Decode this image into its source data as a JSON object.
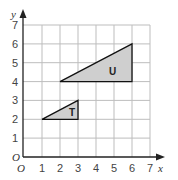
{
  "diagram": {
    "type": "coordinate-grid",
    "x_axis": {
      "label": "x",
      "ticks": [
        "1",
        "2",
        "3",
        "4",
        "5",
        "6",
        "7"
      ],
      "origin_label": "O"
    },
    "y_axis": {
      "label": "y",
      "ticks": [
        "1",
        "2",
        "3",
        "4",
        "5",
        "6",
        "7"
      ],
      "origin_label": "O"
    },
    "shapes": [
      {
        "name": "T",
        "label": "T",
        "vertices": [
          [
            1,
            2
          ],
          [
            3,
            2
          ],
          [
            3,
            3
          ]
        ],
        "fill": "#cfcfcf"
      },
      {
        "name": "U",
        "label": "U",
        "vertices": [
          [
            2,
            4
          ],
          [
            6,
            4
          ],
          [
            6,
            6
          ]
        ],
        "fill": "#cfcfcf"
      }
    ],
    "colors": {
      "grid": "#bdbdbd",
      "axis": "#222222",
      "shape_stroke": "#111111",
      "shape_fill": "#cfcfcf"
    }
  }
}
